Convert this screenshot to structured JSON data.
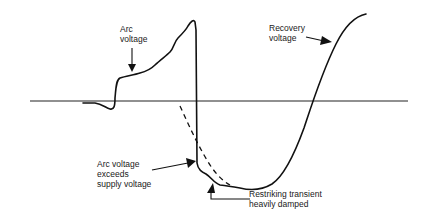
{
  "diagram": {
    "labels": {
      "arc_voltage": [
        "Arc",
        "voltage"
      ],
      "recovery_voltage": [
        "Recovery",
        "voltage"
      ],
      "arc_exceeds": [
        "Arc voltage",
        "exceeds",
        "supply voltage"
      ],
      "restriking": [
        "Restriking transient",
        "heavily damped"
      ]
    },
    "colors": {
      "line": "#111111",
      "background": "#ffffff"
    }
  }
}
